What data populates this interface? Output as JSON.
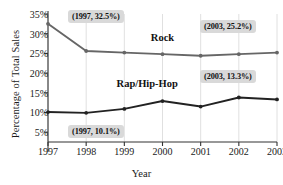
{
  "chart_data": {
    "type": "line",
    "title": "",
    "xlabel": "Year",
    "ylabel": "Percentage of Total Sales",
    "x": [
      1997,
      1998,
      1999,
      2000,
      2001,
      2002,
      2003
    ],
    "xticklabels": [
      "1997",
      "1998",
      "1999",
      "2000",
      "2001",
      "2002",
      "2003"
    ],
    "yticklabels": [
      "35%",
      "30%",
      "25%",
      "20%",
      "15%",
      "10%",
      "5%"
    ],
    "ytickvalues": [
      35,
      30,
      25,
      20,
      15,
      10,
      5
    ],
    "ylim": [
      2.5,
      35
    ],
    "xlim": [
      1997,
      2003
    ],
    "grid": "vertical",
    "legend": "inline-labels",
    "series": [
      {
        "name": "Rock",
        "color": "#666666",
        "label_x": 2000,
        "label_y": 28.6,
        "values": [
          32.5,
          25.6,
          25.2,
          24.8,
          24.4,
          24.8,
          25.2
        ]
      },
      {
        "name": "Rap/Hip-Hop",
        "color": "#222222",
        "label_x": 1999.6,
        "label_y": 16.9,
        "values": [
          10.1,
          9.9,
          10.9,
          12.9,
          11.5,
          13.8,
          13.3
        ]
      }
    ],
    "annotations": [
      {
        "text": "(1997, 32.5%)",
        "x_px": 68,
        "y_px": 10
      },
      {
        "text": "(2003, 25.2%)",
        "x_px": 200,
        "y_px": 20
      },
      {
        "text": "(2003, 13.3%)",
        "x_px": 200,
        "y_px": 70
      },
      {
        "text": "(1997, 10.1%)",
        "x_px": 68,
        "y_px": 125
      }
    ]
  },
  "colors": {
    "rock": "#666666",
    "rap": "#222222",
    "annotation_bg": "#d9d9d9",
    "axis": "#333333",
    "grid": "#d8d8d8"
  }
}
